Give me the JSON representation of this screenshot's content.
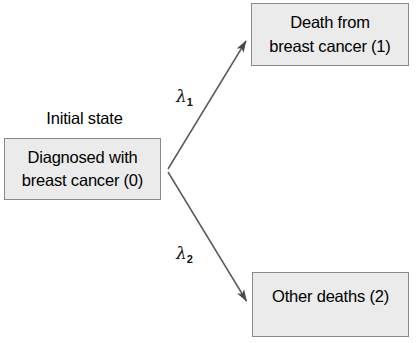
{
  "diagram": {
    "type": "state-transition-diagram",
    "colors": {
      "box_fill": "#ebebeb",
      "box_border": "#8a8a8a",
      "arrow": "#555555",
      "text": "#000000"
    },
    "annotations": {
      "initial_state_label": "Initial state"
    },
    "states": [
      {
        "id": 0,
        "name": "box-initial",
        "lines": [
          "Diagnosed with",
          "breast cancer (0)"
        ],
        "text": "Diagnosed with breast cancer (0)"
      },
      {
        "id": 1,
        "name": "box-death-breast-cancer",
        "lines": [
          "Death from",
          "breast cancer (1)"
        ],
        "text": "Death from breast cancer (1)"
      },
      {
        "id": 2,
        "name": "box-other-deaths",
        "lines": [
          "Other deaths (2)"
        ],
        "text": "Other deaths (2)"
      }
    ],
    "transitions": [
      {
        "name": "transition-0-to-1",
        "from": 0,
        "to": 1,
        "rate_symbol": "λ",
        "rate_subscript": "1",
        "rate_label": "λ1"
      },
      {
        "name": "transition-0-to-2",
        "from": 0,
        "to": 2,
        "rate_symbol": "λ",
        "rate_subscript": "2",
        "rate_label": "λ2"
      }
    ]
  }
}
